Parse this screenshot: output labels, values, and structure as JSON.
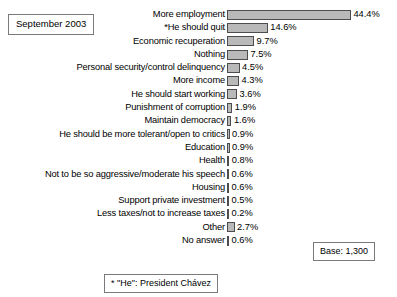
{
  "annotations": {
    "date_label": "September 2003",
    "base_label": "Base: 1,300",
    "footnote": "* \"He\": President Chávez"
  },
  "chart_data": {
    "type": "bar",
    "orientation": "horizontal",
    "title": "",
    "subtitle": "",
    "xlabel": "",
    "ylabel": "",
    "grid": false,
    "legend": false,
    "xlim": [
      0,
      44.4
    ],
    "value_suffix": "%",
    "categories": [
      "More employment",
      "*He should quit",
      "Economic recuperation",
      "Nothing",
      "Personal security/control delinquency",
      "More income",
      "He should start working",
      "Punishment of corruption",
      "Maintain democracy",
      "He should be more tolerant/open to critics",
      "Education",
      "Health",
      "Not to be so aggressive/moderate his speech",
      "Housing",
      "Support private investment",
      "Less taxes/not to increase taxes",
      "Other",
      "No answer"
    ],
    "values": [
      44.4,
      14.6,
      9.7,
      7.5,
      4.5,
      4.3,
      3.6,
      1.9,
      1.6,
      0.9,
      0.9,
      0.8,
      0.6,
      0.6,
      0.5,
      0.2,
      2.7,
      0.6
    ],
    "value_labels": [
      "44.4%",
      "14.6%",
      "9.7%",
      "7.5%",
      "4.5%",
      "4.3%",
      "3.6%",
      "1.9%",
      "1.6%",
      "0.9%",
      "0.9%",
      "0.8%",
      "0.6%",
      "0.6%",
      "0.5%",
      "0.2%",
      "2.7%",
      "0.6%"
    ],
    "colors": {
      "bar_fill": "#b9b9b9",
      "bar_border": "#4d4d4d",
      "background": "#ffffff",
      "text": "#000000",
      "box_border": "#7a7a7a"
    },
    "px_per_unit": 2.79
  }
}
